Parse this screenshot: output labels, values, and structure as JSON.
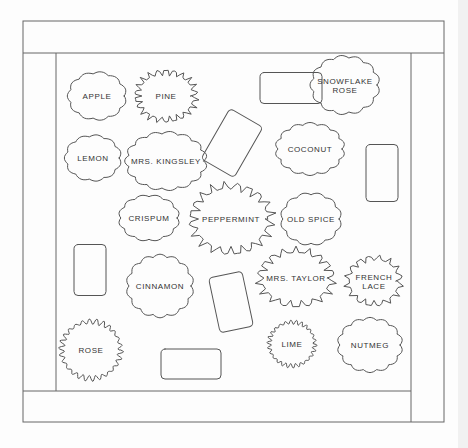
{
  "diagram": {
    "title": "",
    "colors": {
      "background": "#fdfdfd",
      "line": "#555555",
      "text": "#333333",
      "frame": "#666666"
    },
    "frame": {
      "outer": {
        "x": 23,
        "y": 21,
        "w": 421,
        "h": 401
      },
      "inner": {
        "x": 56,
        "y": 53,
        "w": 355,
        "h": 338
      }
    },
    "plants": [
      {
        "id": "apple",
        "label": [
          "APPLE"
        ],
        "cx": 97,
        "cy": 96,
        "rx": 28,
        "ry": 23,
        "style": "scallop",
        "bumps": 11
      },
      {
        "id": "pine",
        "label": [
          "PINE"
        ],
        "cx": 166,
        "cy": 96,
        "rx": 30,
        "ry": 25,
        "style": "spiky",
        "bumps": 22
      },
      {
        "id": "snowflake-rose",
        "label": [
          "SNOWFLAKE",
          "ROSE"
        ],
        "cx": 345,
        "cy": 85,
        "rx": 33,
        "ry": 28,
        "style": "scallop",
        "bumps": 13
      },
      {
        "id": "lemon",
        "label": [
          "LEMON"
        ],
        "cx": 93,
        "cy": 158,
        "rx": 27,
        "ry": 22,
        "style": "scallop",
        "bumps": 11
      },
      {
        "id": "mrs-kingsley",
        "label": [
          "MRS. KINGSLEY"
        ],
        "cx": 166,
        "cy": 161,
        "rx": 39,
        "ry": 28,
        "style": "scallop",
        "bumps": 15
      },
      {
        "id": "coconut",
        "label": [
          "COCONUT"
        ],
        "cx": 310,
        "cy": 149,
        "rx": 33,
        "ry": 25,
        "style": "scallop",
        "bumps": 14
      },
      {
        "id": "crispum",
        "label": [
          "CRISPUM"
        ],
        "cx": 149,
        "cy": 218,
        "rx": 29,
        "ry": 22,
        "style": "scallop",
        "bumps": 12
      },
      {
        "id": "peppermint",
        "label": [
          "PEPPERMINT"
        ],
        "cx": 231,
        "cy": 219,
        "rx": 40,
        "ry": 34,
        "style": "spiky",
        "bumps": 20
      },
      {
        "id": "old-spice",
        "label": [
          "OLD SPICE"
        ],
        "cx": 311,
        "cy": 219,
        "rx": 29,
        "ry": 25,
        "style": "scallop",
        "bumps": 12
      },
      {
        "id": "cinnamon",
        "label": [
          "CINNAMON"
        ],
        "cx": 160,
        "cy": 286,
        "rx": 32,
        "ry": 30,
        "style": "scallop",
        "bumps": 14
      },
      {
        "id": "mrs-taylor",
        "label": [
          "MRS. TAYLOR"
        ],
        "cx": 296,
        "cy": 278,
        "rx": 37,
        "ry": 28,
        "style": "spiky",
        "bumps": 18
      },
      {
        "id": "french-lace",
        "label": [
          "FRENCH",
          "LACE"
        ],
        "cx": 374,
        "cy": 281,
        "rx": 27,
        "ry": 24,
        "style": "spiky",
        "bumps": 16
      },
      {
        "id": "rose",
        "label": [
          "ROSE"
        ],
        "cx": 91,
        "cy": 350,
        "rx": 31,
        "ry": 30,
        "style": "fine",
        "bumps": 26
      },
      {
        "id": "lime",
        "label": [
          "LIME"
        ],
        "cx": 292,
        "cy": 344,
        "rx": 24,
        "ry": 23,
        "style": "fine",
        "bumps": 26
      },
      {
        "id": "nutmeg",
        "label": [
          "NUTMEG"
        ],
        "cx": 370,
        "cy": 345,
        "rx": 31,
        "ry": 26,
        "style": "scallop",
        "bumps": 14
      }
    ],
    "stepping_stones": [
      {
        "id": "stone-1",
        "cx": 291,
        "cy": 88,
        "w": 62,
        "h": 31,
        "rot": 0
      },
      {
        "id": "stone-2",
        "cx": 232,
        "cy": 143,
        "w": 38,
        "h": 58,
        "rot": 30
      },
      {
        "id": "stone-3",
        "cx": 382,
        "cy": 173,
        "w": 32,
        "h": 57,
        "rot": 0
      },
      {
        "id": "stone-4",
        "cx": 90,
        "cy": 270,
        "w": 32,
        "h": 51,
        "rot": 0
      },
      {
        "id": "stone-5",
        "cx": 231,
        "cy": 302,
        "w": 34,
        "h": 56,
        "rot": -12
      },
      {
        "id": "stone-6",
        "cx": 191,
        "cy": 364,
        "w": 60,
        "h": 30,
        "rot": 0
      }
    ]
  }
}
